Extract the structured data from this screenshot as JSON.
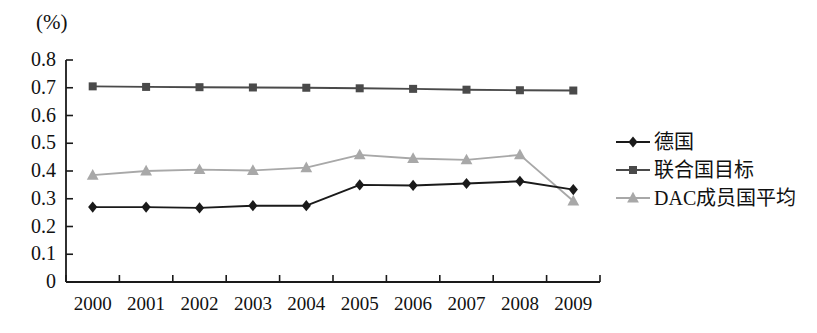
{
  "chart_data": {
    "type": "line",
    "title": "",
    "subtitle": "",
    "unit_label": "(%)",
    "xlabel": "",
    "ylabel": "",
    "categories": [
      "2000",
      "2001",
      "2002",
      "2003",
      "2004",
      "2005",
      "2006",
      "2007",
      "2008",
      "2009"
    ],
    "ylim": [
      0,
      0.8
    ],
    "ytick_labels": [
      "0.8",
      "0.7",
      "0.6",
      "0.5",
      "0.4",
      "0.3",
      "0.2",
      "0.1",
      "0"
    ],
    "ytick_values": [
      0.8,
      0.7,
      0.6,
      0.5,
      0.4,
      0.3,
      0.2,
      0.1,
      0
    ],
    "grid": false,
    "legend_position": "right",
    "series": [
      {
        "name": "德国",
        "marker": "diamond",
        "color": "#1a1a1a",
        "values": [
          0.27,
          0.27,
          0.267,
          0.275,
          0.275,
          0.35,
          0.348,
          0.355,
          0.363,
          0.333
        ]
      },
      {
        "name": "联合国目标",
        "marker": "square",
        "color": "#4a4a4a",
        "values": [
          0.705,
          0.703,
          0.702,
          0.701,
          0.7,
          0.698,
          0.696,
          0.693,
          0.691,
          0.69
        ]
      },
      {
        "name": "DAC成员国平均",
        "marker": "triangle",
        "color": "#a8a8a8",
        "values": [
          0.385,
          0.4,
          0.405,
          0.402,
          0.412,
          0.458,
          0.445,
          0.44,
          0.458,
          0.292
        ]
      }
    ]
  },
  "axis": {
    "frame_color": "#1a1a1a"
  }
}
